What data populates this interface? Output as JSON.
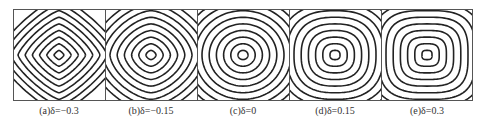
{
  "figure": {
    "panels": [
      {
        "label": "(a)δ=−0.3",
        "delta": -0.3
      },
      {
        "label": "(b)δ=−0.15",
        "delta": -0.15
      },
      {
        "label": "(c)δ=0",
        "delta": 0
      },
      {
        "label": "(d)δ=0.15",
        "delta": 0.15
      },
      {
        "label": "(e)δ=0.3",
        "delta": 0.3
      }
    ],
    "contour_levels": 9,
    "line_color": "#222222",
    "frame_color": "#555555"
  }
}
